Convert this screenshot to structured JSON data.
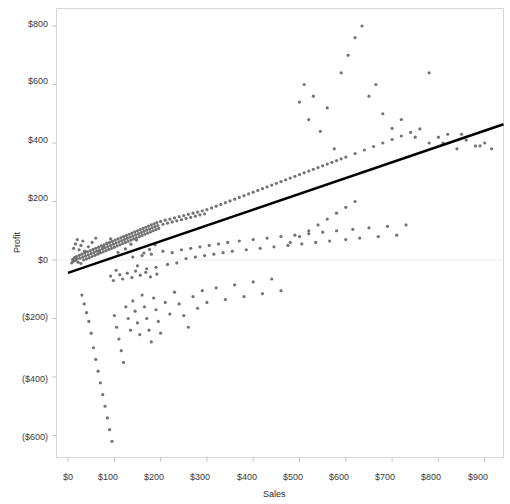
{
  "chart_data": {
    "type": "scatter",
    "title": "",
    "subtitle": "",
    "xlabel": "Sales",
    "ylabel": "Profit",
    "xlim": [
      -20,
      960
    ],
    "ylim": [
      -680,
      840
    ],
    "xticks": [
      0,
      100,
      200,
      300,
      400,
      500,
      600,
      700,
      800,
      900
    ],
    "xtick_labels": [
      "$0",
      "$100",
      "$200",
      "$300",
      "$400",
      "$500",
      "$600",
      "$700",
      "$800",
      "$900"
    ],
    "yticks": [
      800,
      600,
      400,
      200,
      0,
      -200,
      -400,
      -600
    ],
    "ytick_labels": [
      "$800",
      "$600",
      "$400",
      "$200",
      "$0",
      "($200)",
      "($400)",
      "($600)"
    ],
    "grid": "horizontal-zero-only",
    "legend": "none",
    "marker": {
      "shape": "circle",
      "color": "#6b6b6b",
      "size_px": 3.2,
      "opacity": 0.95
    },
    "trendline": {
      "type": "linear",
      "color": "#000000",
      "width_px": 2.6,
      "x_start": 0,
      "y_start": -44,
      "x_end": 955,
      "y_end": 472
    },
    "series": [
      {
        "name": "Orders",
        "points": [
          [
            8,
            -10
          ],
          [
            10,
            2
          ],
          [
            12,
            -4
          ],
          [
            14,
            8
          ],
          [
            16,
            -2
          ],
          [
            18,
            12
          ],
          [
            20,
            4
          ],
          [
            22,
            -8
          ],
          [
            24,
            16
          ],
          [
            26,
            6
          ],
          [
            28,
            -12
          ],
          [
            30,
            20
          ],
          [
            32,
            10
          ],
          [
            34,
            0
          ],
          [
            36,
            24
          ],
          [
            38,
            14
          ],
          [
            40,
            4
          ],
          [
            42,
            28
          ],
          [
            44,
            18
          ],
          [
            46,
            8
          ],
          [
            48,
            32
          ],
          [
            50,
            22
          ],
          [
            52,
            12
          ],
          [
            54,
            36
          ],
          [
            56,
            26
          ],
          [
            58,
            16
          ],
          [
            60,
            40
          ],
          [
            62,
            30
          ],
          [
            64,
            20
          ],
          [
            66,
            44
          ],
          [
            68,
            34
          ],
          [
            70,
            24
          ],
          [
            72,
            48
          ],
          [
            74,
            38
          ],
          [
            76,
            28
          ],
          [
            78,
            52
          ],
          [
            80,
            42
          ],
          [
            82,
            32
          ],
          [
            84,
            56
          ],
          [
            86,
            46
          ],
          [
            88,
            36
          ],
          [
            90,
            60
          ],
          [
            92,
            50
          ],
          [
            94,
            40
          ],
          [
            96,
            64
          ],
          [
            98,
            54
          ],
          [
            100,
            44
          ],
          [
            102,
            68
          ],
          [
            104,
            58
          ],
          [
            106,
            48
          ],
          [
            108,
            72
          ],
          [
            110,
            62
          ],
          [
            112,
            52
          ],
          [
            114,
            76
          ],
          [
            116,
            66
          ],
          [
            118,
            56
          ],
          [
            120,
            80
          ],
          [
            122,
            70
          ],
          [
            124,
            60
          ],
          [
            126,
            84
          ],
          [
            128,
            74
          ],
          [
            130,
            64
          ],
          [
            132,
            88
          ],
          [
            134,
            78
          ],
          [
            136,
            68
          ],
          [
            138,
            92
          ],
          [
            140,
            82
          ],
          [
            142,
            72
          ],
          [
            144,
            96
          ],
          [
            146,
            86
          ],
          [
            148,
            76
          ],
          [
            150,
            100
          ],
          [
            152,
            90
          ],
          [
            154,
            80
          ],
          [
            156,
            104
          ],
          [
            158,
            94
          ],
          [
            160,
            84
          ],
          [
            162,
            108
          ],
          [
            164,
            98
          ],
          [
            166,
            88
          ],
          [
            168,
            112
          ],
          [
            170,
            102
          ],
          [
            172,
            92
          ],
          [
            174,
            116
          ],
          [
            176,
            106
          ],
          [
            178,
            96
          ],
          [
            180,
            120
          ],
          [
            182,
            110
          ],
          [
            184,
            100
          ],
          [
            186,
            124
          ],
          [
            188,
            114
          ],
          [
            190,
            104
          ],
          [
            192,
            128
          ],
          [
            194,
            118
          ],
          [
            196,
            108
          ],
          [
            200,
            132
          ],
          [
            205,
            122
          ],
          [
            210,
            136
          ],
          [
            215,
            126
          ],
          [
            220,
            140
          ],
          [
            225,
            130
          ],
          [
            230,
            144
          ],
          [
            235,
            134
          ],
          [
            240,
            148
          ],
          [
            245,
            138
          ],
          [
            250,
            152
          ],
          [
            255,
            142
          ],
          [
            260,
            156
          ],
          [
            265,
            146
          ],
          [
            270,
            160
          ],
          [
            275,
            150
          ],
          [
            280,
            164
          ],
          [
            285,
            154
          ],
          [
            290,
            168
          ],
          [
            295,
            158
          ],
          [
            300,
            172
          ],
          [
            310,
            178
          ],
          [
            320,
            184
          ],
          [
            330,
            190
          ],
          [
            340,
            196
          ],
          [
            350,
            202
          ],
          [
            360,
            208
          ],
          [
            370,
            214
          ],
          [
            380,
            220
          ],
          [
            390,
            226
          ],
          [
            400,
            232
          ],
          [
            410,
            238
          ],
          [
            420,
            244
          ],
          [
            430,
            250
          ],
          [
            440,
            256
          ],
          [
            450,
            262
          ],
          [
            460,
            268
          ],
          [
            470,
            274
          ],
          [
            480,
            280
          ],
          [
            490,
            286
          ],
          [
            500,
            292
          ],
          [
            510,
            298
          ],
          [
            520,
            304
          ],
          [
            530,
            310
          ],
          [
            540,
            316
          ],
          [
            550,
            322
          ],
          [
            560,
            328
          ],
          [
            570,
            334
          ],
          [
            580,
            340
          ],
          [
            590,
            346
          ],
          [
            600,
            352
          ],
          [
            620,
            364
          ],
          [
            640,
            376
          ],
          [
            660,
            388
          ],
          [
            680,
            400
          ],
          [
            700,
            412
          ],
          [
            720,
            424
          ],
          [
            740,
            436
          ],
          [
            760,
            448
          ],
          [
            780,
            400
          ],
          [
            800,
            420
          ],
          [
            820,
            430
          ],
          [
            840,
            380
          ],
          [
            860,
            410
          ],
          [
            880,
            390
          ],
          [
            900,
            400
          ],
          [
            915,
            380
          ],
          [
            30,
            -120
          ],
          [
            35,
            -150
          ],
          [
            40,
            -180
          ],
          [
            45,
            -210
          ],
          [
            50,
            -250
          ],
          [
            55,
            -300
          ],
          [
            60,
            -340
          ],
          [
            65,
            -380
          ],
          [
            70,
            -420
          ],
          [
            75,
            -460
          ],
          [
            80,
            -500
          ],
          [
            85,
            -540
          ],
          [
            90,
            -580
          ],
          [
            95,
            -620
          ],
          [
            100,
            -190
          ],
          [
            105,
            -230
          ],
          [
            110,
            -270
          ],
          [
            115,
            -310
          ],
          [
            120,
            -350
          ],
          [
            125,
            -160
          ],
          [
            130,
            -200
          ],
          [
            135,
            -240
          ],
          [
            140,
            -140
          ],
          [
            145,
            -175
          ],
          [
            150,
            -215
          ],
          [
            155,
            -255
          ],
          [
            160,
            -120
          ],
          [
            165,
            -160
          ],
          [
            170,
            -200
          ],
          [
            175,
            -240
          ],
          [
            180,
            -280
          ],
          [
            185,
            -130
          ],
          [
            190,
            -170
          ],
          [
            195,
            -210
          ],
          [
            200,
            -250
          ],
          [
            210,
            -145
          ],
          [
            220,
            -185
          ],
          [
            230,
            -110
          ],
          [
            240,
            -150
          ],
          [
            250,
            -190
          ],
          [
            260,
            -230
          ],
          [
            270,
            -125
          ],
          [
            280,
            -165
          ],
          [
            290,
            -105
          ],
          [
            300,
            -145
          ],
          [
            320,
            -95
          ],
          [
            340,
            -135
          ],
          [
            360,
            -85
          ],
          [
            380,
            -125
          ],
          [
            400,
            -75
          ],
          [
            420,
            -115
          ],
          [
            440,
            -65
          ],
          [
            460,
            -105
          ],
          [
            480,
            60
          ],
          [
            500,
            80
          ],
          [
            520,
            100
          ],
          [
            540,
            120
          ],
          [
            560,
            140
          ],
          [
            580,
            160
          ],
          [
            600,
            180
          ],
          [
            620,
            200
          ],
          [
            500,
            540
          ],
          [
            510,
            600
          ],
          [
            520,
            480
          ],
          [
            530,
            560
          ],
          [
            545,
            440
          ],
          [
            560,
            520
          ],
          [
            575,
            380
          ],
          [
            590,
            640
          ],
          [
            605,
            700
          ],
          [
            620,
            760
          ],
          [
            635,
            800
          ],
          [
            650,
            560
          ],
          [
            665,
            600
          ],
          [
            680,
            500
          ],
          [
            700,
            450
          ],
          [
            720,
            480
          ],
          [
            750,
            420
          ],
          [
            780,
            640
          ],
          [
            810,
            400
          ],
          [
            850,
            430
          ],
          [
            890,
            390
          ],
          [
            140,
            10
          ],
          [
            150,
            -20
          ],
          [
            160,
            15
          ],
          [
            170,
            -30
          ],
          [
            180,
            20
          ],
          [
            190,
            -25
          ],
          [
            205,
            30
          ],
          [
            215,
            -15
          ],
          [
            225,
            25
          ],
          [
            235,
            -10
          ],
          [
            245,
            35
          ],
          [
            255,
            5
          ],
          [
            265,
            40
          ],
          [
            275,
            10
          ],
          [
            285,
            45
          ],
          [
            295,
            15
          ],
          [
            305,
            50
          ],
          [
            315,
            20
          ],
          [
            325,
            55
          ],
          [
            335,
            25
          ],
          [
            345,
            60
          ],
          [
            355,
            30
          ],
          [
            370,
            65
          ],
          [
            385,
            35
          ],
          [
            400,
            70
          ],
          [
            415,
            40
          ],
          [
            430,
            75
          ],
          [
            445,
            45
          ],
          [
            460,
            80
          ],
          [
            475,
            50
          ],
          [
            490,
            85
          ],
          [
            505,
            55
          ],
          [
            520,
            90
          ],
          [
            535,
            60
          ],
          [
            550,
            95
          ],
          [
            565,
            65
          ],
          [
            580,
            100
          ],
          [
            600,
            70
          ],
          [
            615,
            105
          ],
          [
            630,
            75
          ],
          [
            650,
            110
          ],
          [
            670,
            80
          ],
          [
            690,
            115
          ],
          [
            710,
            85
          ],
          [
            730,
            120
          ],
          [
            12,
            40
          ],
          [
            16,
            55
          ],
          [
            20,
            70
          ],
          [
            24,
            35
          ],
          [
            28,
            50
          ],
          [
            32,
            65
          ],
          [
            36,
            30
          ],
          [
            44,
            45
          ],
          [
            52,
            60
          ],
          [
            60,
            75
          ],
          [
            68,
            28
          ],
          [
            76,
            42
          ],
          [
            84,
            58
          ],
          [
            92,
            72
          ],
          [
            108,
            26
          ],
          [
            124,
            38
          ],
          [
            136,
            54
          ],
          [
            148,
            68
          ],
          [
            164,
            24
          ],
          [
            176,
            36
          ],
          [
            188,
            52
          ],
          [
            92,
            -55
          ],
          [
            98,
            -70
          ],
          [
            104,
            -35
          ],
          [
            112,
            -50
          ],
          [
            118,
            -65
          ],
          [
            128,
            -45
          ],
          [
            138,
            -60
          ],
          [
            146,
            -38
          ],
          [
            156,
            -52
          ],
          [
            168,
            -42
          ],
          [
            178,
            -58
          ],
          [
            192,
            -48
          ]
        ]
      }
    ]
  },
  "axes": {
    "y_label": "Profit",
    "x_label": "Sales"
  }
}
